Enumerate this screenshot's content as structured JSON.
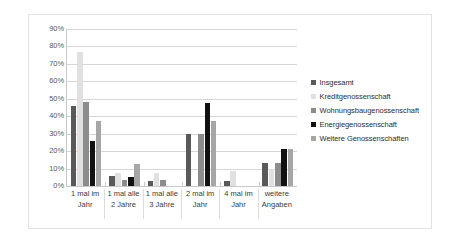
{
  "chart_data": {
    "type": "bar",
    "title": "",
    "subtitle": "",
    "xlabel": "",
    "ylabel": "",
    "ylim": [
      0,
      90
    ],
    "grid": true,
    "legend_position": "right",
    "ytick_labels": [
      "90%",
      "80%",
      "70%",
      "60%",
      "50%",
      "40%",
      "30%",
      "20%",
      "10%",
      "0%"
    ],
    "ytick_values": [
      90,
      80,
      70,
      60,
      50,
      40,
      30,
      20,
      10,
      0
    ],
    "categories": [
      "1 mal im Jahr",
      "1 mal alle 2 Jahre",
      "1 mal alle 3 Jahre",
      "2 mal im Jahr",
      "4 mal im Jahr",
      "weitere Angaben"
    ],
    "series": [
      {
        "name": "Insgesamt",
        "color": "#595959",
        "values": [
          46,
          6,
          3,
          30,
          3,
          13
        ]
      },
      {
        "name": "Kreditgenossenschaft",
        "color": "#e0e0e0",
        "values": [
          77,
          7.5,
          7.5,
          0,
          8.5,
          10
        ]
      },
      {
        "name": "Wohnungsbaugenossenschaft",
        "color": "#8c8c8c",
        "values": [
          48,
          3.5,
          3.5,
          30,
          0,
          13
        ]
      },
      {
        "name": "Energiegenossenschaft",
        "color": "#111111",
        "values": [
          26,
          5,
          0,
          47.5,
          0,
          21
        ]
      },
      {
        "name": "Weitere Genossenschaften",
        "color": "#a6a6a6",
        "values": [
          37.5,
          12.5,
          0,
          37.5,
          0,
          21
        ]
      }
    ]
  },
  "legend": {
    "items": [
      {
        "label": "Insgesamt",
        "color": "#595959"
      },
      {
        "label": "Kreditgenossenschaft",
        "color": "#e0e0e0"
      },
      {
        "label": "Wohnungsbaugenossenschaft",
        "color": "#8c8c8c"
      },
      {
        "label": "Energiegenossenschaft",
        "color": "#111111"
      },
      {
        "label": "Weitere Genossenschaften",
        "color": "#a6a6a6"
      }
    ]
  },
  "colors": {
    "plot_background": "#ffffff",
    "gridline": "#d6d6d6",
    "axis_line": "#c9c9c9",
    "frame_border": "#e3e3e3",
    "tick_text": "#5a5a5a",
    "category_text": "#3b3b3b",
    "legend_text": "#2e2e2e"
  }
}
